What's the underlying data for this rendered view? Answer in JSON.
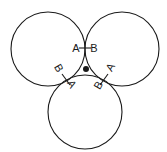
{
  "diagram": {
    "stroke_color": "#1a1a1a",
    "background": "#ffffff",
    "circles": [
      {
        "name": "top-left",
        "cx": 48,
        "cy": 49,
        "r": 37
      },
      {
        "name": "top-right",
        "cx": 122,
        "cy": 49,
        "r": 37
      },
      {
        "name": "bottom",
        "cx": 85,
        "cy": 112,
        "r": 37
      }
    ],
    "center_dot": {
      "cx": 86,
      "cy": 69,
      "r": 3
    },
    "junctions": [
      {
        "name": "top",
        "tick": {
          "x1": 79,
          "y1": 48,
          "x2": 91,
          "y2": 48
        },
        "label_a": {
          "text": "A",
          "x": 76,
          "y": 52,
          "rotate": 0
        },
        "label_b": {
          "text": "B",
          "x": 94,
          "y": 52,
          "rotate": 0
        }
      },
      {
        "name": "left",
        "tick": {
          "x1": 62,
          "y1": 74,
          "x2": 70,
          "y2": 85
        },
        "label_b": {
          "text": "B",
          "x": 59,
          "y": 72,
          "rotate": 60
        },
        "label_a": {
          "text": "A",
          "x": 72,
          "y": 88,
          "rotate": 60
        }
      },
      {
        "name": "right",
        "tick": {
          "x1": 108,
          "y1": 74,
          "x2": 100,
          "y2": 85
        },
        "label_a": {
          "text": "A",
          "x": 110,
          "y": 71,
          "rotate": -60
        },
        "label_b": {
          "text": "B",
          "x": 98,
          "y": 89,
          "rotate": -60
        }
      }
    ]
  }
}
